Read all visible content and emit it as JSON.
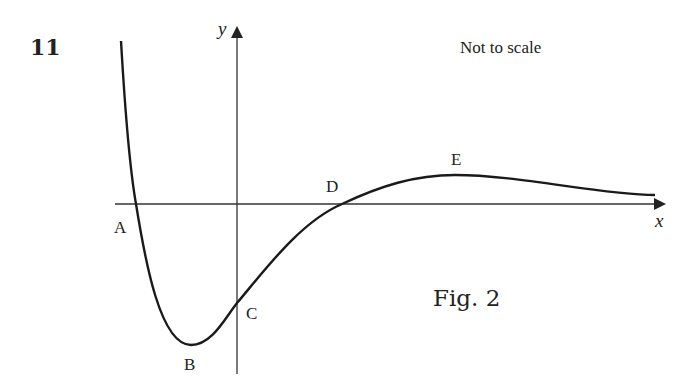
{
  "question_number": "11",
  "note": "Not to scale",
  "figure_label": "Fig. 2",
  "axes": {
    "x_label": "x",
    "y_label": "y"
  },
  "points": [
    {
      "label": "A",
      "description": "left x-intercept"
    },
    {
      "label": "B",
      "description": "local minimum"
    },
    {
      "label": "C",
      "description": "y-intercept"
    },
    {
      "label": "D",
      "description": "right x-intercept"
    },
    {
      "label": "E",
      "description": "local maximum"
    }
  ],
  "colors": {
    "line": "#1a1a1a",
    "background": "#ffffff"
  }
}
